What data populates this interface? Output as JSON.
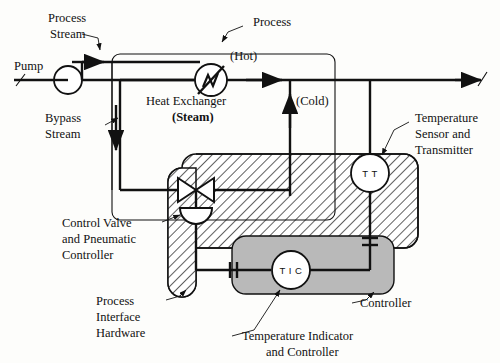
{
  "diagram": {
    "colors": {
      "line": "#111111",
      "background": "#fdfdfb",
      "hatch_fill": "#ffffff",
      "controller_fill": "#b9b9b9"
    },
    "labels": {
      "process_stream": {
        "line1": "Process",
        "line2": "Stream"
      },
      "pump": "Pump",
      "bypass_stream": {
        "line1": "Bypass",
        "line2": "Stream"
      },
      "process": "Process",
      "hot": "(Hot)",
      "cold": "(Cold)",
      "heat_exchanger": {
        "line1": "Heat Exchanger",
        "line2": "(Steam)"
      },
      "temperature_sensor": {
        "line1": "Temperature",
        "line2": "Sensor and",
        "line3": "Transmitter"
      },
      "control_valve": {
        "line1": "Control Valve",
        "line2": "and Pneumatic",
        "line3": "Controller"
      },
      "process_interface": {
        "line1": "Process",
        "line2": "Interface",
        "line3": "Hardware"
      },
      "temperature_indicator": {
        "line1": "Temperature Indicator",
        "line2": "and Controller"
      },
      "controller": "Controller"
    },
    "instrument_tags": {
      "transmitter": "T T",
      "indicating_controller": "T I C"
    }
  }
}
